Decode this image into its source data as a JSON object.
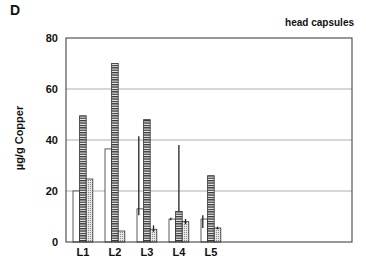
{
  "panel_label": "D",
  "chart_data": {
    "type": "bar",
    "title": "head capsules",
    "panel": "D",
    "xlabel": "",
    "ylabel": "µg/g Copper",
    "ylim": [
      0,
      80
    ],
    "yticks": [
      0,
      20,
      40,
      60,
      80
    ],
    "grid": "horizontal",
    "categories": [
      "L1",
      "L2",
      "L3",
      "L4",
      "L5"
    ],
    "series": [
      {
        "name": "series 1 (open)",
        "pattern": "white",
        "values": [
          20,
          36.5,
          13,
          9,
          9
        ],
        "error_upper": [
          null,
          null,
          41.5,
          9.5,
          10.5
        ],
        "error_lower": [
          null,
          null,
          10.5,
          8.5,
          5.5
        ]
      },
      {
        "name": "series 2 (horizontal hatch)",
        "pattern": "hatched",
        "values": [
          49.5,
          70,
          48,
          12,
          26
        ],
        "error_upper": [
          null,
          null,
          null,
          38,
          null
        ],
        "error_lower": [
          null,
          null,
          null,
          null,
          null
        ]
      },
      {
        "name": "series 3 (stippled)",
        "pattern": "dotted",
        "values": [
          24.7,
          4.3,
          5,
          8,
          5.5
        ],
        "error_upper": [
          null,
          null,
          6.5,
          9,
          6
        ],
        "error_lower": [
          null,
          null,
          4,
          7,
          5
        ]
      }
    ],
    "legend": null
  }
}
